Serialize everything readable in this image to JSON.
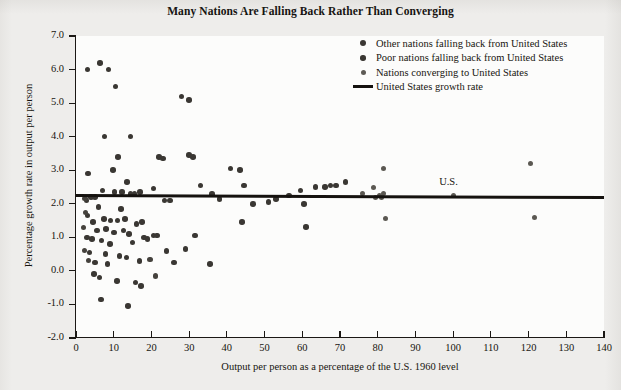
{
  "chart_data": {
    "type": "scatter",
    "title": "Many Nations Are Falling Back Rather Than Converging",
    "xlabel": "Output per person as a percentage of the U.S. 1960 level",
    "ylabel": "Percentage growth rate in output per person",
    "xlim": [
      0,
      140
    ],
    "ylim": [
      -2.0,
      7.0
    ],
    "xticks": [
      0,
      10,
      20,
      30,
      40,
      50,
      60,
      70,
      80,
      90,
      100,
      110,
      120,
      130,
      140
    ],
    "yticks": [
      "7.0",
      "6.0",
      "5.0",
      "4.0",
      "3.0",
      "2.0",
      "1.0",
      "0.0",
      "-1.0",
      "-2.0"
    ],
    "grid": false,
    "legend_position": "top-right",
    "reference_line": {
      "label": "United States growth rate",
      "y_start": 2.28,
      "y_end": 2.22,
      "color": "#15120f"
    },
    "annotations": [
      {
        "text": "U.S.",
        "x": 100,
        "y": 2.6
      }
    ],
    "legend": [
      {
        "label": "Other nations falling back from United States",
        "marker": "circle",
        "color": "#3a3733",
        "size": 6
      },
      {
        "label": "Poor nations falling back from United States",
        "marker": "circle",
        "color": "#3a3733",
        "size": 5.5
      },
      {
        "label": "Nations converging to United States",
        "marker": "circle",
        "color": "#5d5a55",
        "size": 5
      },
      {
        "label": "United States growth rate",
        "marker": "line",
        "color": "#15120f",
        "size": 3
      }
    ],
    "series": [
      {
        "name": "Other nations falling back from United States",
        "color": "#3a3733",
        "marker_size": 5.6,
        "points": [
          [
            3.1,
            6.0
          ],
          [
            6.4,
            6.2
          ],
          [
            8.6,
            6.0
          ],
          [
            10.5,
            5.5
          ],
          [
            28.0,
            5.2
          ],
          [
            30.0,
            5.1
          ],
          [
            7.6,
            4.0
          ],
          [
            14.4,
            4.0
          ],
          [
            11.2,
            3.4
          ],
          [
            22.0,
            3.4
          ],
          [
            23.0,
            3.35
          ],
          [
            30.0,
            3.45
          ],
          [
            31.0,
            3.4
          ],
          [
            3.2,
            2.9
          ],
          [
            9.8,
            3.0
          ],
          [
            13.6,
            2.65
          ],
          [
            7.0,
            2.4
          ],
          [
            10.2,
            2.35
          ],
          [
            14.5,
            2.3
          ],
          [
            15.5,
            2.3
          ],
          [
            20.6,
            2.45
          ],
          [
            12.2,
            2.35
          ],
          [
            4.0,
            2.2
          ],
          [
            5.1,
            2.2
          ],
          [
            17.0,
            2.35
          ],
          [
            6.0,
            1.9
          ],
          [
            12.0,
            1.85
          ],
          [
            2.8,
            2.1
          ],
          [
            23.5,
            2.1
          ],
          [
            25.0,
            2.1
          ],
          [
            3.0,
            1.65
          ],
          [
            4.5,
            1.45
          ],
          [
            7.4,
            1.55
          ],
          [
            9.2,
            1.5
          ],
          [
            11.0,
            1.5
          ],
          [
            13.0,
            1.55
          ],
          [
            16.0,
            1.4
          ],
          [
            17.5,
            1.45
          ],
          [
            5.6,
            1.2
          ],
          [
            8.0,
            1.25
          ],
          [
            10.0,
            1.15
          ],
          [
            12.6,
            1.2
          ],
          [
            14.0,
            1.1
          ],
          [
            2.9,
            1.0
          ],
          [
            4.2,
            0.95
          ],
          [
            6.8,
            0.9
          ],
          [
            9.0,
            0.8
          ],
          [
            15.0,
            0.85
          ],
          [
            18.0,
            1.0
          ],
          [
            3.6,
            0.55
          ],
          [
            7.8,
            0.5
          ],
          [
            11.5,
            0.45
          ],
          [
            13.4,
            0.4
          ],
          [
            5.0,
            0.25
          ],
          [
            8.4,
            0.2
          ],
          [
            16.8,
            0.3
          ],
          [
            4.8,
            -0.1
          ],
          [
            6.2,
            -0.2
          ],
          [
            10.8,
            -0.3
          ],
          [
            15.8,
            -0.35
          ],
          [
            17.2,
            -0.45
          ],
          [
            6.6,
            -0.85
          ],
          [
            13.8,
            -1.05
          ],
          [
            19.0,
            0.95
          ],
          [
            20.5,
            1.05
          ],
          [
            21.5,
            1.05
          ],
          [
            24.0,
            0.6
          ],
          [
            26.0,
            0.25
          ],
          [
            29.0,
            0.65
          ],
          [
            33.0,
            2.55
          ],
          [
            36.0,
            2.3
          ],
          [
            38.0,
            2.15
          ],
          [
            41.0,
            3.05
          ],
          [
            43.5,
            3.0
          ],
          [
            44.5,
            2.55
          ],
          [
            44.0,
            1.45
          ],
          [
            31.5,
            1.05
          ],
          [
            35.5,
            0.2
          ],
          [
            47.0,
            2.0
          ],
          [
            51.0,
            2.05
          ],
          [
            53.0,
            2.15
          ],
          [
            56.5,
            2.25
          ],
          [
            59.5,
            2.4
          ],
          [
            60.5,
            2.0
          ],
          [
            61.0,
            1.3
          ],
          [
            63.5,
            2.5
          ],
          [
            66.0,
            2.5
          ],
          [
            67.5,
            2.55
          ],
          [
            69.0,
            2.55
          ],
          [
            71.5,
            2.65
          ]
        ]
      },
      {
        "name": "Poor nations falling back from United States",
        "color": "#45423d",
        "marker_size": 5.2,
        "points": [
          [
            2.4,
            2.15
          ],
          [
            2.6,
            1.75
          ],
          [
            3.4,
            0.3
          ],
          [
            2.2,
            0.6
          ],
          [
            2.0,
            1.3
          ],
          [
            19.6,
            0.35
          ],
          [
            21.0,
            -0.15
          ]
        ]
      },
      {
        "name": "Nations converging to United States",
        "color": "#5b5852",
        "marker_size": 5.0,
        "points": [
          [
            76.0,
            2.3
          ],
          [
            79.5,
            2.2
          ],
          [
            80.5,
            2.25
          ],
          [
            81.0,
            2.2
          ],
          [
            81.5,
            2.3
          ],
          [
            79.0,
            2.5
          ],
          [
            81.5,
            3.05
          ],
          [
            82.0,
            1.55
          ],
          [
            100.0,
            2.25
          ],
          [
            120.5,
            3.2
          ],
          [
            121.5,
            1.6
          ]
        ]
      }
    ]
  }
}
